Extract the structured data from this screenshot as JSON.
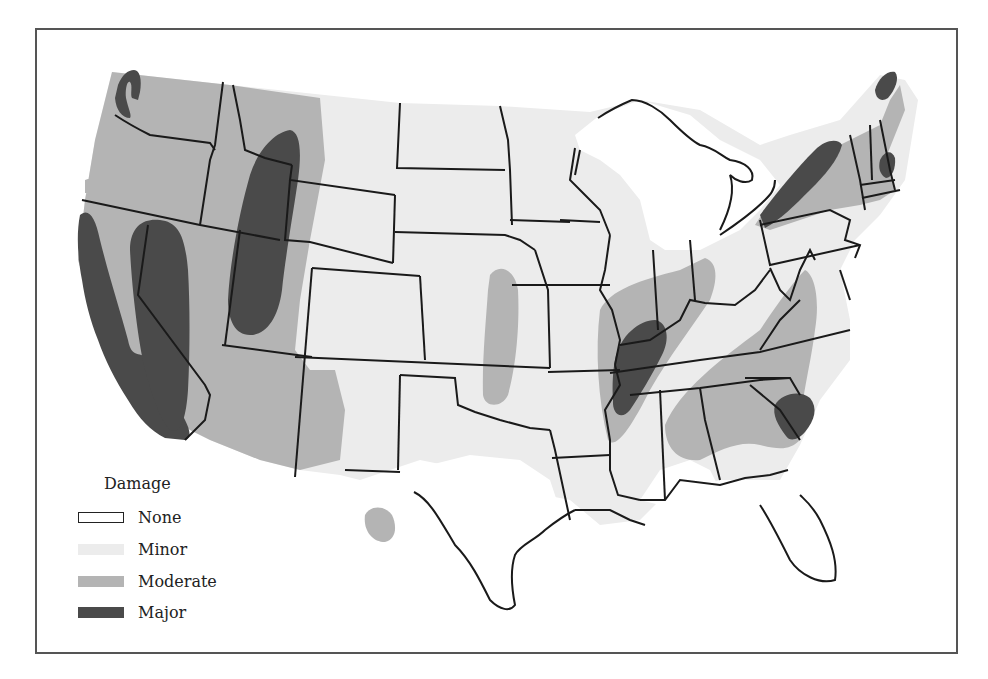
{
  "map": {
    "title": "",
    "subject": "Damage across the contiguous United States",
    "colors": {
      "none": "#ffffff",
      "minor": "#ececec",
      "moderate": "#b4b4b4",
      "major": "#4a4a4a",
      "border": "#1a1a1a"
    }
  },
  "legend": {
    "title": "Damage",
    "items": [
      {
        "label": "None",
        "color": "#ffffff",
        "outlined": true
      },
      {
        "label": "Minor",
        "color": "#ececec",
        "outlined": false
      },
      {
        "label": "Moderate",
        "color": "#b4b4b4",
        "outlined": false
      },
      {
        "label": "Major",
        "color": "#4a4a4a",
        "outlined": false
      }
    ]
  }
}
